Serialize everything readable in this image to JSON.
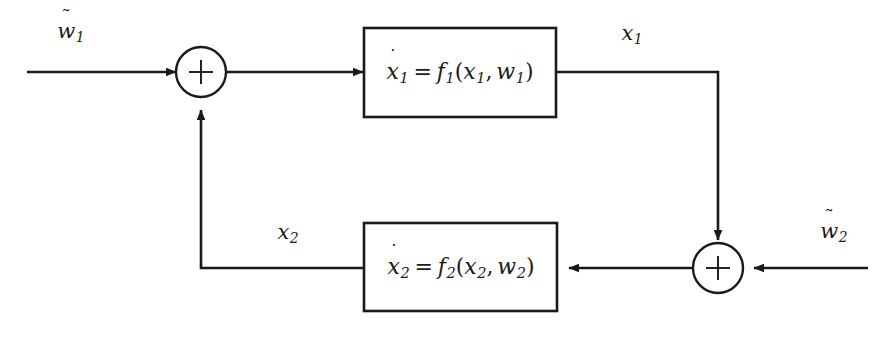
{
  "diagram": {
    "background_color": "#ffffff",
    "line_color": "#1a1a1a",
    "text_color": "#1a1a1a",
    "blocks": [
      {
        "id": "block-1",
        "equation_plain": "ẋ₁ = f₁(x₁, w₁)",
        "state": "x",
        "state_index": "1",
        "function": "f",
        "function_index": "1",
        "arg1": "x",
        "arg1_index": "1",
        "arg2": "w",
        "arg2_index": "1"
      },
      {
        "id": "block-2",
        "equation_plain": "ẋ₂ = f₂(x₂, w₂)",
        "state": "x",
        "state_index": "2",
        "function": "f",
        "function_index": "2",
        "arg1": "x",
        "arg1_index": "2",
        "arg2": "w",
        "arg2_index": "2"
      }
    ],
    "summing_junctions": [
      {
        "id": "sum-1",
        "symbol": "+"
      },
      {
        "id": "sum-2",
        "symbol": "+"
      }
    ],
    "signal_labels": [
      {
        "id": "input-1",
        "base": "w",
        "index": "1",
        "accent": "tilde",
        "plain": "w̃₁"
      },
      {
        "id": "output-1",
        "base": "x",
        "index": "1",
        "accent": "none",
        "plain": "x₁"
      },
      {
        "id": "input-2",
        "base": "w",
        "index": "2",
        "accent": "tilde",
        "plain": "w̃₂"
      },
      {
        "id": "output-2",
        "base": "x",
        "index": "2",
        "accent": "none",
        "plain": "x₂"
      }
    ],
    "symbols": {
      "tilde": "˜",
      "dot": "˙",
      "equals": "=",
      "comma": ",",
      "lparen": "(",
      "rparen": ")",
      "plus": "+"
    }
  }
}
